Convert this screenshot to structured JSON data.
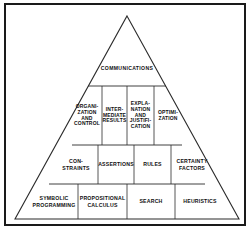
{
  "figure": {
    "type": "pyramid-diagram",
    "background_color": "#ffffff",
    "border_color": "#1a1a1a",
    "line_color": "#2b2b2b",
    "text_color": "#101010"
  },
  "pyramid": {
    "apex": {
      "label": "COMMUNICATIONS"
    },
    "rows": [
      {
        "name": "row-communications",
        "cells": [
          {
            "label": "COMMUNICATIONS"
          }
        ]
      },
      {
        "name": "row-reasoning-services",
        "cells": [
          {
            "label": "ORGANI-\nZATION\nAND\nCONTROL"
          },
          {
            "label": "INTER-\nMEDIATE\nRESULTS"
          },
          {
            "label": "EXPLA-\nNATION\nAND\nJUSTIFI-\nCATION"
          },
          {
            "label": "OPTIMI-\nZATION"
          }
        ]
      },
      {
        "name": "row-knowledge-representation",
        "cells": [
          {
            "label": "CON-\nSTRAINTS"
          },
          {
            "label": "ASSERTIONS"
          },
          {
            "label": "RULES"
          },
          {
            "label": "CERTAINTY\nFACTORS"
          }
        ]
      },
      {
        "name": "row-foundations",
        "cells": [
          {
            "label": "SYMBOLIC\nPROGRAMMING"
          },
          {
            "label": "PROPOSITIONAL\nCALCULUS"
          },
          {
            "label": "SEARCH"
          },
          {
            "label": "HEURISTICS"
          }
        ]
      }
    ]
  }
}
